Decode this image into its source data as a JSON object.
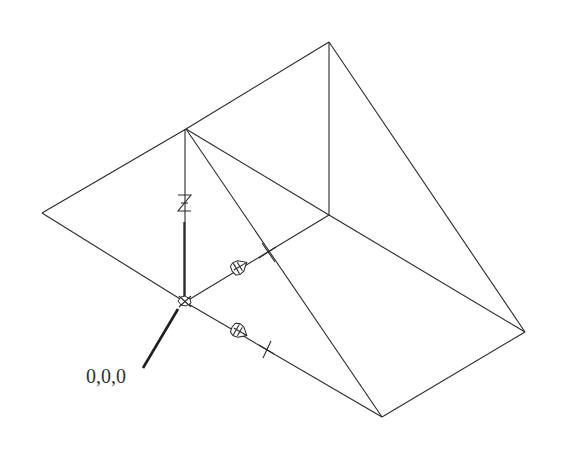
{
  "diagram": {
    "title": "",
    "labels": {
      "origin": "0,0,0",
      "z_axis": "Z"
    },
    "vertices": {
      "apex": [
        186,
        129
      ],
      "top": [
        329,
        42
      ],
      "left": [
        42,
        213
      ],
      "inner": [
        329,
        215
      ],
      "right": [
        525,
        332
      ],
      "bottom": [
        382,
        417
      ],
      "origin": [
        185,
        302
      ]
    },
    "colors": {
      "line": "#2a2a2a",
      "text": "#333333",
      "background": "#ffffff"
    },
    "icons": [
      "ucs-origin-marker",
      "arrow-cone-icon",
      "x-tick-mark"
    ]
  }
}
